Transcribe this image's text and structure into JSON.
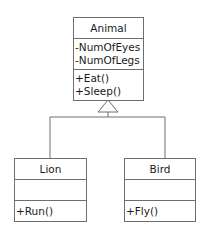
{
  "diagram": {
    "type": "uml-class-diagram",
    "relationship": "generalization",
    "classes": [
      {
        "name": "Animal",
        "attributes": [
          "-NumOfEyes",
          "-NumOfLegs"
        ],
        "methods": [
          "+Eat()",
          "+Sleep()"
        ]
      },
      {
        "name": "Lion",
        "attributes": [],
        "methods": [
          "+Run()"
        ]
      },
      {
        "name": "Bird",
        "attributes": [],
        "methods": [
          "+Fly()"
        ]
      }
    ],
    "edges": [
      {
        "from": "Lion",
        "to": "Animal",
        "kind": "inheritance"
      },
      {
        "from": "Bird",
        "to": "Animal",
        "kind": "inheritance"
      }
    ],
    "colors": {
      "line": "#6e6e6e",
      "text": "#1a1a1a",
      "background": "#ffffff"
    }
  }
}
